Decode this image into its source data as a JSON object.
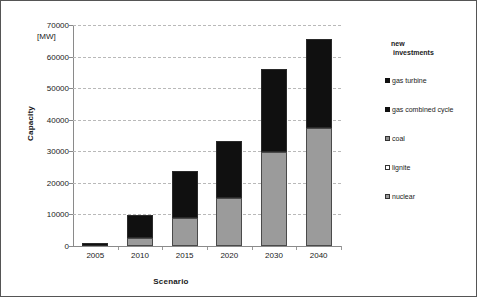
{
  "chart_data": {
    "type": "bar",
    "title": "",
    "subtitle": "",
    "xlabel": "Scenario",
    "ylabel": "Capacity",
    "unit_label": "[MW]",
    "ylim": [
      0,
      70000
    ],
    "ytick_values": [
      0,
      10000,
      20000,
      30000,
      40000,
      50000,
      60000,
      70000
    ],
    "ytick_labels": [
      "0",
      "10000",
      "20000",
      "30000",
      "40000",
      "50000",
      "60000",
      "70000"
    ],
    "grid": "horizontal-dashed",
    "stacked": true,
    "legend_position": "right",
    "legend_title": "new investments",
    "categories": [
      "2005",
      "2010",
      "2015",
      "2020",
      "2030",
      "2040"
    ],
    "series": [
      {
        "name": "nuclear",
        "color": "#9b9b9b",
        "values": [
          0,
          2500,
          8800,
          15300,
          29800,
          37500
        ]
      },
      {
        "name": "lignite",
        "color": "#ffffff",
        "values": [
          0,
          0,
          0,
          0,
          0,
          0
        ]
      },
      {
        "name": "coal",
        "color": "#8f8f8f",
        "values": [
          0,
          0,
          0,
          0,
          0,
          0
        ]
      },
      {
        "name": "gas combined cycle",
        "color": "#101010",
        "values": [
          0,
          0,
          0,
          0,
          0,
          0
        ]
      },
      {
        "name": "gas turbine",
        "color": "#101010",
        "values": [
          1000,
          7200,
          14800,
          17800,
          26200,
          28100
        ]
      }
    ],
    "totals": [
      1000,
      9700,
      23600,
      33100,
      56000,
      65600
    ]
  },
  "legend": {
    "title_line1": "new",
    "title_line2": "investments",
    "entries": [
      {
        "label": "gas turbine",
        "swatch": "sw-gasturbine"
      },
      {
        "label": "gas combined cycle",
        "swatch": "sw-gascc"
      },
      {
        "label": "coal",
        "swatch": "sw-coal"
      },
      {
        "label": "lignite",
        "swatch": "sw-lignite"
      },
      {
        "label": "nuclear",
        "swatch": "sw-nuclear"
      }
    ]
  }
}
